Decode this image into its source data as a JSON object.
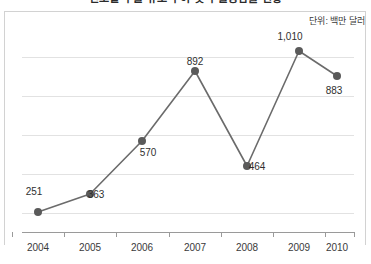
{
  "title": "연도별 수출 규모 추이 및 수출증감률 현황",
  "unit_label": "단위: 백만 달러",
  "colors": {
    "line": "#6b6b6b",
    "marker": "#5a5a5a",
    "gridline": "#e2e2e2",
    "axis": "#9a9a9a",
    "text": "#2f2f2f",
    "frame": "#d2d2d2"
  },
  "chart_data": {
    "type": "line",
    "title": "연도별 수출 규모 추이 및 수출증감률 현황",
    "xlabel": "",
    "ylabel": "",
    "unit": "단위: 백만 달러",
    "categories": [
      "2004",
      "2005",
      "2006",
      "2007",
      "2008",
      "2009",
      "2010"
    ],
    "values": [
      251,
      363,
      570,
      892,
      464,
      1010,
      883
    ],
    "value_labels": [
      "251",
      "363",
      "570",
      "892",
      "464",
      "1,010",
      "883"
    ],
    "ylim": [
      0,
      1100
    ],
    "grid": true,
    "gridlines": [
      180,
      360,
      540,
      720,
      900,
      1080
    ],
    "legend": null,
    "legend_position": "none",
    "series": [
      {
        "name": "수출액",
        "values": [
          251,
          363,
          570,
          892,
          464,
          1010,
          883
        ]
      }
    ]
  },
  "points": [
    {
      "x": 38,
      "y": 212,
      "label": "251",
      "lx": 34,
      "ly": 186
    },
    {
      "x": 90,
      "y": 194,
      "label": "363",
      "lx": 96,
      "ly": 189
    },
    {
      "x": 142,
      "y": 141,
      "label": "570",
      "lx": 148,
      "ly": 147
    },
    {
      "x": 195,
      "y": 71,
      "label": "892",
      "lx": 195,
      "ly": 56
    },
    {
      "x": 247,
      "y": 166,
      "label": "464",
      "lx": 257,
      "ly": 161
    },
    {
      "x": 299,
      "y": 51,
      "label": "1,010",
      "lx": 290,
      "ly": 31
    },
    {
      "x": 337,
      "y": 76,
      "label": "883",
      "lx": 334,
      "ly": 85
    }
  ],
  "gridline_y": [
    57,
    96,
    135,
    174,
    213
  ],
  "tick_x": [
    12,
    64,
    116,
    169,
    221,
    273,
    325,
    354
  ],
  "x_label_x": [
    38,
    90,
    142,
    195,
    247,
    299,
    337
  ]
}
